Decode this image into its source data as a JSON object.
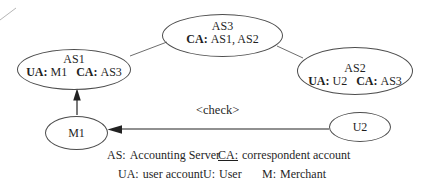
{
  "figure": {
    "nodes": {
      "as1": {
        "title": "AS1",
        "pairs": [
          {
            "label": "UA:",
            "value": "M1"
          },
          {
            "label": "CA:",
            "value": "AS3"
          }
        ]
      },
      "as3": {
        "title": "AS3",
        "pairs": [
          {
            "label": "CA:",
            "value": "AS1, AS2"
          }
        ]
      },
      "as2": {
        "title": "AS2",
        "pairs": [
          {
            "label": "UA:",
            "value": "U2"
          },
          {
            "label": "CA:",
            "value": "AS3"
          }
        ]
      },
      "m1": {
        "title": "M1"
      },
      "u2": {
        "title": "U2"
      }
    },
    "edge_label": "<check>",
    "colors": {
      "ink": "#1f1f1f",
      "ellipse_stroke": "#4d4d4d",
      "connector": "#6e6e6e",
      "arrow": "#222222"
    }
  },
  "legend": {
    "items": [
      {
        "term": "AS:",
        "def": "Accounting Server"
      },
      {
        "term": "CA:",
        "def": "correspondent account"
      },
      {
        "term": "UA:",
        "def": "user account"
      },
      {
        "term": "U:",
        "def": "User"
      },
      {
        "term": "M:",
        "def": "Merchant"
      }
    ]
  }
}
